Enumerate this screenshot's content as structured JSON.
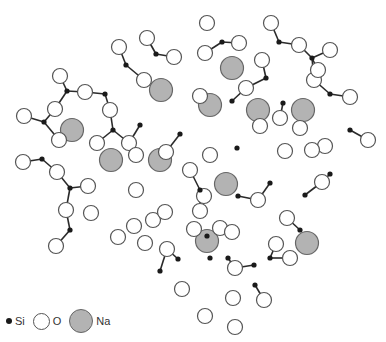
{
  "diagram": {
    "legend": [
      {
        "key": "si",
        "label": "Si",
        "symbol": "small-black-dot"
      },
      {
        "key": "o",
        "label": "O",
        "symbol": "white-circle"
      },
      {
        "key": "na",
        "label": "Na",
        "symbol": "grey-circle"
      }
    ],
    "colors": {
      "si": "#1a1a1a",
      "o": "#ffffff",
      "na": "#b3b3b3",
      "bond": "#2a2a2a"
    },
    "si": [
      [
        156,
        54
      ],
      [
        126,
        65
      ],
      [
        105,
        94
      ],
      [
        67,
        91
      ],
      [
        44,
        122
      ],
      [
        42,
        159
      ],
      [
        70,
        188
      ],
      [
        70,
        230
      ],
      [
        140,
        125
      ],
      [
        113,
        130
      ],
      [
        180,
        134
      ],
      [
        222,
        42
      ],
      [
        279,
        42
      ],
      [
        312,
        58
      ],
      [
        266,
        78
      ],
      [
        232,
        101
      ],
      [
        237,
        148
      ],
      [
        283,
        103
      ],
      [
        330,
        94
      ],
      [
        350,
        130
      ],
      [
        270,
        183
      ],
      [
        238,
        196
      ],
      [
        200,
        190
      ],
      [
        207,
        236
      ],
      [
        178,
        259
      ],
      [
        160,
        271
      ],
      [
        210,
        258
      ],
      [
        228,
        258
      ],
      [
        270,
        258
      ],
      [
        254,
        265
      ],
      [
        300,
        230
      ],
      [
        330,
        174
      ],
      [
        305,
        195
      ],
      [
        255,
        285
      ]
    ],
    "o": [
      [
        147,
        38
      ],
      [
        119,
        47
      ],
      [
        60,
        76
      ],
      [
        85,
        92
      ],
      [
        144,
        80
      ],
      [
        110,
        110
      ],
      [
        55,
        109
      ],
      [
        59,
        140
      ],
      [
        24,
        116
      ],
      [
        23,
        162
      ],
      [
        97,
        143
      ],
      [
        129,
        143
      ],
      [
        174,
        57
      ],
      [
        207,
        23
      ],
      [
        239,
        43
      ],
      [
        205,
        53
      ],
      [
        271,
        23
      ],
      [
        299,
        45
      ],
      [
        330,
        50
      ],
      [
        262,
        60
      ],
      [
        314,
        80
      ],
      [
        246,
        88
      ],
      [
        280,
        118
      ],
      [
        260,
        126
      ],
      [
        300,
        128
      ],
      [
        285,
        151
      ],
      [
        325,
        146
      ],
      [
        368,
        140
      ],
      [
        350,
        97
      ],
      [
        318,
        70
      ],
      [
        57,
        172
      ],
      [
        88,
        186
      ],
      [
        66,
        210
      ],
      [
        91,
        213
      ],
      [
        56,
        246
      ],
      [
        136,
        155
      ],
      [
        166,
        152
      ],
      [
        136,
        190
      ],
      [
        134,
        226
      ],
      [
        153,
        220
      ],
      [
        118,
        237
      ],
      [
        145,
        243
      ],
      [
        167,
        249
      ],
      [
        194,
        229
      ],
      [
        190,
        170
      ],
      [
        210,
        155
      ],
      [
        204,
        196
      ],
      [
        220,
        228
      ],
      [
        200,
        211
      ],
      [
        165,
        212
      ],
      [
        232,
        232
      ],
      [
        276,
        244
      ],
      [
        287,
        218
      ],
      [
        322,
        182
      ],
      [
        312,
        150
      ],
      [
        290,
        258
      ],
      [
        264,
        300
      ],
      [
        235,
        268
      ],
      [
        233,
        298
      ],
      [
        182,
        289
      ],
      [
        205,
        316
      ],
      [
        235,
        327
      ],
      [
        258,
        200
      ],
      [
        200,
        96
      ]
    ],
    "na": [
      [
        161,
        90
      ],
      [
        72,
        130
      ],
      [
        111,
        160
      ],
      [
        160,
        160
      ],
      [
        232,
        68
      ],
      [
        210,
        105
      ],
      [
        258,
        110
      ],
      [
        303,
        110
      ],
      [
        226,
        184
      ],
      [
        207,
        241
      ],
      [
        307,
        243
      ]
    ]
  }
}
